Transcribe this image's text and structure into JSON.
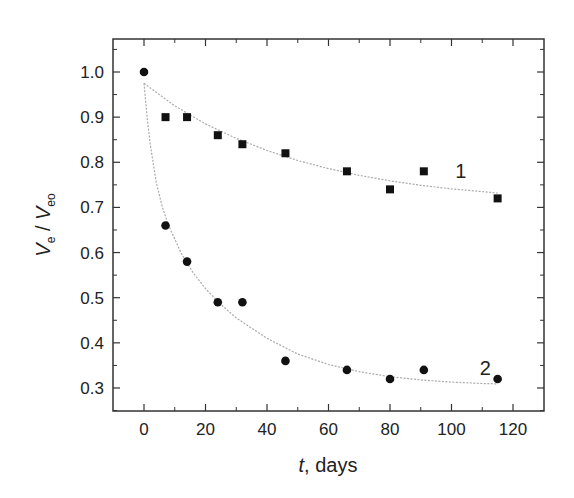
{
  "chart_data": {
    "type": "scatter",
    "title": "",
    "xlabel": "t , days",
    "xlabel_var": "t",
    "xlabel_unit": ", days",
    "ylabel": "Ve / Veo",
    "ylabel_parts": {
      "v1": "V",
      "sub1": "e",
      "slash": " / ",
      "v2": "V",
      "sub2": "eo"
    },
    "xlim": [
      -10,
      130
    ],
    "ylim": [
      0.25,
      1.07
    ],
    "xticks": [
      0,
      20,
      40,
      60,
      80,
      100,
      120
    ],
    "xtick_labels": [
      "0",
      "20",
      "40",
      "60",
      "80",
      "100",
      "120"
    ],
    "yticks": [
      0.3,
      0.4,
      0.5,
      0.6,
      0.7,
      0.8,
      0.9,
      1.0
    ],
    "ytick_labels": [
      "0.3",
      "0.4",
      "0.5",
      "0.6",
      "0.7",
      "0.8",
      "0.9",
      "1.0"
    ],
    "grid": false,
    "legend": "none (curves labeled inline)",
    "series": [
      {
        "name": "1",
        "marker": "square",
        "x": [
          0,
          7,
          14,
          24,
          32,
          46,
          66,
          80,
          91,
          115
        ],
        "y": [
          1.0,
          0.9,
          0.9,
          0.86,
          0.84,
          0.82,
          0.78,
          0.74,
          0.78,
          0.72
        ],
        "fit": "exponential decay",
        "fit_x": [
          0,
          10,
          20,
          30,
          40,
          50,
          60,
          70,
          80,
          90,
          100,
          110,
          115
        ],
        "fit_y": [
          0.975,
          0.925,
          0.885,
          0.853,
          0.826,
          0.804,
          0.786,
          0.771,
          0.759,
          0.749,
          0.741,
          0.735,
          0.732
        ],
        "label_pos": {
          "x": 103,
          "y": 0.78
        }
      },
      {
        "name": "2",
        "marker": "circle",
        "x": [
          0,
          7,
          14,
          24,
          32,
          46,
          66,
          80,
          91,
          115
        ],
        "y": [
          1.0,
          0.66,
          0.58,
          0.49,
          0.49,
          0.36,
          0.34,
          0.32,
          0.34,
          0.32
        ],
        "fit": "exponential decay",
        "fit_x": [
          0,
          1,
          2,
          4,
          6,
          8,
          12,
          16,
          20,
          25,
          30,
          40,
          50,
          60,
          70,
          80,
          90,
          100,
          110,
          115
        ],
        "fit_y": [
          0.975,
          0.9,
          0.84,
          0.755,
          0.7,
          0.66,
          0.6,
          0.555,
          0.52,
          0.485,
          0.455,
          0.41,
          0.375,
          0.352,
          0.336,
          0.325,
          0.318,
          0.313,
          0.31,
          0.309
        ],
        "label_pos": {
          "x": 111,
          "y": 0.345
        }
      }
    ]
  }
}
